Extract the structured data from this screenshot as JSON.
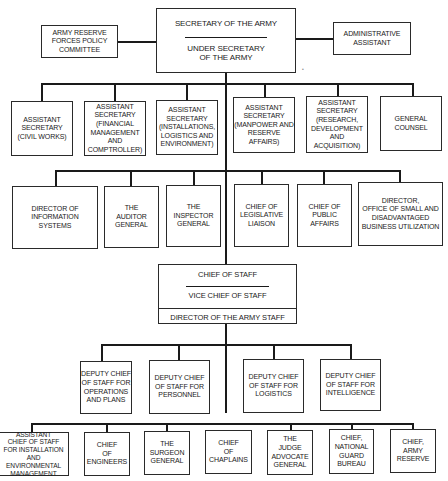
{
  "chart": {
    "top": {
      "secretary": "SECRETARY OF THE ARMY",
      "under_secretary": "UNDER SECRETARY\nOF THE ARMY",
      "left_advisory": "ARMY RESERVE\nFORCES POLICY\nCOMMITTEE",
      "right_advisory": "ADMINISTRATIVE\nASSISTANT"
    },
    "assistant_secretaries": [
      "ASSISTANT\nSECRETARY\n(CIVIL WORKS)",
      "ASSISTANT\nSECRETARY\n(FINANCIAL\nMANAGEMENT\nAND COMPTROLLER)",
      "ASSISTANT\nSECRETARY\n(INSTALLATIONS,\nLOGISTICS AND\nENVIRONMENT)",
      "ASSISTANT\nSECRETARY\n(MANPOWER AND\nRESERVE\nAFFAIRS)",
      "ASSISTANT\nSECRETARY\n(RESEARCH,\nDEVELOPMENT\nAND\nACQUISITION)",
      "GENERAL\nCOUNSEL"
    ],
    "secretariat_offices": [
      "DIRECTOR OF\nINFORMATION\nSYSTEMS",
      "THE\nAUDITOR\nGENERAL",
      "THE\nINSPECTOR\nGENERAL",
      "CHIEF OF\nLEGISLATIVE\nLIAISON",
      "CHIEF OF\nPUBLIC\nAFFAIRS",
      "DIRECTOR,\nOFFICE OF SMALL AND\nDISADVANTAGED\nBUSINESS UTILIZATION"
    ],
    "army_staff": {
      "chief": "CHIEF OF STAFF",
      "vice_chief": "VICE CHIEF OF STAFF",
      "director": "DIRECTOR OF THE ARMY STAFF"
    },
    "deputy_chiefs": [
      "DEPUTY CHIEF\nOF STAFF FOR\nOPERATIONS\nAND PLANS",
      "DEPUTY CHIEF\nOF STAFF FOR\nPERSONNEL",
      "DEPUTY CHIEF\nOF STAFF FOR\nLOGISTICS",
      "DEPUTY CHIEF\nOF STAFF FOR\nINTELLIGENCE"
    ],
    "special_staff": [
      "ASSISTANT\nCHIEF OF STAFF\nFOR INSTALLATION\nAND ENVIRONMENTAL\nMANAGEMENT",
      "CHIEF\nOF\nENGINEERS",
      "THE\nSURGEON\nGENERAL",
      "CHIEF\nOF\nCHAPLAINS",
      "THE\nJUDGE\nADVOCATE\nGENERAL",
      "CHIEF,\nNATIONAL\nGUARD\nBUREAU",
      "CHIEF,\nARMY\nRESERVE"
    ]
  }
}
